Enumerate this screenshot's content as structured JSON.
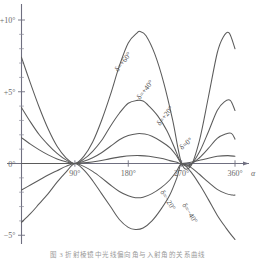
{
  "figure": {
    "caption": "图 3   折射棱镜中光线偏向角与入射角的关系曲线"
  },
  "chart_data": {
    "type": "line",
    "title": "",
    "xlabel": "α",
    "ylabel": "",
    "xlim": [
      0,
      375
    ],
    "ylim": [
      -6,
      11
    ],
    "grid": false,
    "legend_position": "inline-curve-labels",
    "x_ticks": [
      90,
      180,
      270,
      360
    ],
    "x_tick_labels": [
      "90°",
      "180°",
      "270°",
      "360°"
    ],
    "y_ticks": [
      -5,
      0,
      5,
      10
    ],
    "y_tick_labels": [
      "−5°",
      "0°",
      "+5°",
      "+10°"
    ],
    "y_minor_ticks": [
      -4,
      -3,
      -2,
      -1,
      1,
      2,
      3,
      4,
      6,
      7,
      8,
      9
    ],
    "x_axis_symbol": "α",
    "parameter_symbol": "δ",
    "series": [
      {
        "name": "δ=+60°",
        "label": "δ=+60°",
        "label_x": 118,
        "label_y": 72,
        "label_rotate": -52,
        "amplitude": 9.2,
        "x": [
          0,
          15,
          30,
          45,
          60,
          75,
          90,
          105,
          120,
          135,
          150,
          165,
          180,
          195,
          200,
          210,
          225,
          240,
          255,
          270,
          285,
          300,
          315,
          330,
          340,
          350,
          360
        ],
        "y": [
          7.4,
          5.6,
          3.9,
          2.4,
          1.2,
          0.4,
          0.0,
          0.5,
          1.5,
          3.0,
          4.8,
          6.8,
          8.4,
          9.1,
          9.2,
          8.9,
          7.6,
          5.6,
          3.0,
          0.0,
          -0.2,
          1.6,
          4.6,
          7.7,
          8.8,
          9.1,
          8.0
        ]
      },
      {
        "name": "δ=+40°",
        "label": "δ=+40°",
        "label_x": 140,
        "label_y": 100,
        "label_rotate": -52,
        "amplitude": 4.4,
        "x": [
          0,
          15,
          30,
          45,
          60,
          75,
          90,
          105,
          120,
          135,
          150,
          165,
          180,
          195,
          205,
          215,
          230,
          245,
          258,
          270,
          285,
          300,
          315,
          330,
          342,
          352,
          360
        ],
        "y": [
          3.9,
          2.9,
          2.0,
          1.3,
          0.7,
          0.25,
          0.0,
          0.3,
          0.85,
          1.6,
          2.6,
          3.5,
          4.2,
          4.4,
          4.35,
          4.0,
          3.3,
          2.3,
          1.1,
          0.0,
          -0.1,
          0.8,
          2.2,
          3.7,
          4.3,
          4.4,
          3.7
        ]
      },
      {
        "name": "δ=+20°",
        "label": "δ=+20°",
        "label_x": 160,
        "label_y": 126,
        "label_rotate": -52,
        "amplitude": 2.1,
        "x": [
          0,
          15,
          30,
          45,
          60,
          75,
          90,
          105,
          120,
          135,
          150,
          165,
          180,
          195,
          208,
          220,
          235,
          250,
          262,
          270,
          285,
          300,
          315,
          330,
          344,
          354,
          360
        ],
        "y": [
          1.8,
          1.35,
          0.95,
          0.6,
          0.32,
          0.12,
          0.0,
          0.15,
          0.4,
          0.75,
          1.2,
          1.65,
          1.95,
          2.08,
          2.05,
          1.9,
          1.55,
          1.1,
          0.5,
          0.0,
          -0.05,
          0.4,
          1.05,
          1.75,
          2.05,
          2.1,
          1.7
        ]
      },
      {
        "name": "δ=0°",
        "label": "δ=0°",
        "label_x": 182,
        "label_y": 150,
        "label_rotate": -40,
        "amplitude": 0.55,
        "x": [
          0,
          20,
          40,
          60,
          75,
          90,
          110,
          130,
          150,
          170,
          185,
          200,
          215,
          235,
          250,
          262,
          270,
          290,
          310,
          330,
          348,
          360
        ],
        "y": [
          0.0,
          0.0,
          0.0,
          0.0,
          0.0,
          0.0,
          0.06,
          0.18,
          0.34,
          0.48,
          0.54,
          0.55,
          0.5,
          0.36,
          0.2,
          0.08,
          0.0,
          0.12,
          0.32,
          0.5,
          0.55,
          0.5
        ]
      },
      {
        "name": "δ=−20°",
        "label": "δ=−20°",
        "label_x": 160,
        "label_y": 192,
        "label_rotate": 58,
        "amplitude": -2.4,
        "x": [
          0,
          15,
          30,
          45,
          60,
          75,
          90,
          105,
          120,
          135,
          150,
          165,
          180,
          192,
          205,
          220,
          235,
          250,
          262,
          270,
          285,
          300,
          315,
          330,
          345,
          356,
          360
        ],
        "y": [
          -1.85,
          -1.5,
          -1.15,
          -0.8,
          -0.5,
          -0.2,
          0.0,
          -0.2,
          -0.55,
          -1.0,
          -1.5,
          -1.95,
          -2.25,
          -2.38,
          -2.35,
          -2.1,
          -1.7,
          -1.15,
          -0.5,
          0.0,
          -0.25,
          -0.75,
          -1.3,
          -1.8,
          -2.1,
          -2.2,
          -2.2
        ]
      },
      {
        "name": "δ=−40°",
        "label": "δ=−40°",
        "label_x": 182,
        "label_y": 205,
        "label_rotate": 58,
        "amplitude": -4.6,
        "x": [
          0,
          15,
          30,
          45,
          60,
          75,
          90,
          105,
          120,
          135,
          150,
          165,
          180,
          192,
          205,
          220,
          235,
          250,
          262,
          270,
          285,
          300,
          315,
          330,
          345,
          356,
          360
        ],
        "y": [
          -4.1,
          -3.5,
          -2.8,
          -2.1,
          -1.3,
          -0.6,
          0.0,
          -0.45,
          -1.2,
          -2.1,
          -3.0,
          -3.9,
          -4.45,
          -4.6,
          -4.5,
          -4.0,
          -3.2,
          -2.2,
          -1.0,
          0.0,
          -0.55,
          -1.45,
          -2.5,
          -3.6,
          -4.5,
          -5.1,
          -5.3
        ]
      }
    ]
  }
}
